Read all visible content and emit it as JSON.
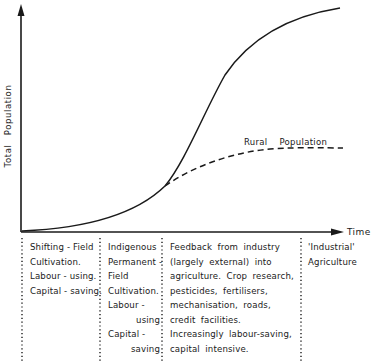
{
  "diagram": {
    "y_axis_label": "Total  Population",
    "x_axis_label": "Time",
    "curves": [
      {
        "name": "Total Population",
        "style": "solid",
        "shape": "sigmoid rising to plateau"
      },
      {
        "name": "Rural Population",
        "style": "dashed",
        "label": "Rural  Population",
        "shape": "branches from total curve and levels off"
      }
    ],
    "stages": [
      {
        "lines": [
          "Shifting - Field",
          "Cultivation.",
          "Labour - using.",
          "Capital - saving."
        ]
      },
      {
        "lines": [
          "Indigenous",
          "Permanent -",
          "Field",
          "Cultivation.",
          "Labour -",
          "using",
          "Capital -",
          "saving"
        ]
      },
      {
        "lines": [
          "Feedback  from  industry",
          "(largely  external)  into",
          "agriculture.  Crop  research,",
          "pesticides,  fertilisers,",
          "mechanisation,  roads,",
          "credit  facilities.",
          "Increasingly  labour-saving,",
          "capital  intensive."
        ]
      },
      {
        "lines": [
          "'Industrial'",
          "Agriculture"
        ]
      }
    ]
  }
}
